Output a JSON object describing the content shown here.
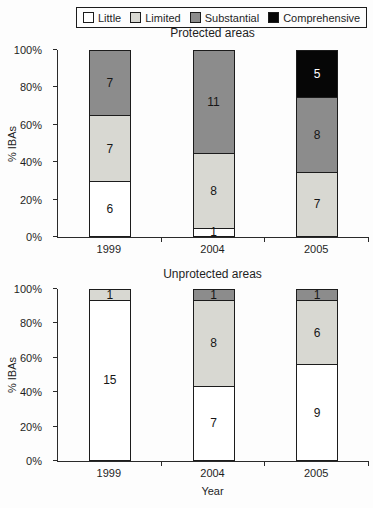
{
  "legend": {
    "items": [
      {
        "label": "Little",
        "color": "#ffffff"
      },
      {
        "label": "Limited",
        "color": "#d8d8d2"
      },
      {
        "label": "Substantial",
        "color": "#8c8c8c"
      },
      {
        "label": "Comprehensive",
        "color": "#060606"
      }
    ]
  },
  "axis": {
    "ylabel": "% IBAs",
    "xlabel": "Year",
    "yticks": [
      "0%",
      "20%",
      "40%",
      "60%",
      "80%",
      "100%"
    ]
  },
  "chart_data": [
    {
      "type": "bar",
      "stacked": true,
      "title": "Protected areas",
      "categories": [
        "1999",
        "2004",
        "2005"
      ],
      "series": [
        {
          "name": "Little",
          "values": [
            6,
            1,
            0
          ]
        },
        {
          "name": "Limited",
          "values": [
            7,
            8,
            7
          ]
        },
        {
          "name": "Substantial",
          "values": [
            7,
            11,
            8
          ]
        },
        {
          "name": "Comprehensive",
          "values": [
            0,
            0,
            5
          ]
        }
      ],
      "totals": [
        20,
        20,
        20
      ],
      "ylabel": "% IBAs",
      "ylim": [
        0,
        100
      ],
      "grid": false,
      "legend_position": "top-center"
    },
    {
      "type": "bar",
      "stacked": true,
      "title": "Unprotected areas",
      "categories": [
        "1999",
        "2004",
        "2005"
      ],
      "series": [
        {
          "name": "Little",
          "values": [
            15,
            7,
            9
          ]
        },
        {
          "name": "Limited",
          "values": [
            1,
            8,
            6
          ]
        },
        {
          "name": "Substantial",
          "values": [
            0,
            1,
            1
          ]
        },
        {
          "name": "Comprehensive",
          "values": [
            0,
            0,
            0
          ]
        }
      ],
      "totals": [
        16,
        16,
        16
      ],
      "ylabel": "% IBAs",
      "xlabel": "Year",
      "ylim": [
        0,
        100
      ],
      "grid": false
    }
  ]
}
